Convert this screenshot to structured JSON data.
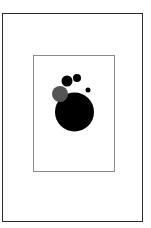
{
  "figure": {
    "outer_frame": {
      "border_color": "#2a2a2a"
    },
    "inner_frame": {
      "border_color": "#8a8a8a"
    },
    "circles": [
      {
        "name": "large-black",
        "cx": 74.5,
        "cy": 112,
        "r": 19.5,
        "color": "#000000"
      },
      {
        "name": "gray",
        "cx": 60,
        "cy": 94,
        "r": 8,
        "color": "#555555"
      },
      {
        "name": "medium-black",
        "cx": 67,
        "cy": 81,
        "r": 5.5,
        "color": "#000000"
      },
      {
        "name": "small-black",
        "cx": 77,
        "cy": 78,
        "r": 4,
        "color": "#000000"
      },
      {
        "name": "tiny-black",
        "cx": 88,
        "cy": 90,
        "r": 2.5,
        "color": "#000000"
      }
    ]
  }
}
